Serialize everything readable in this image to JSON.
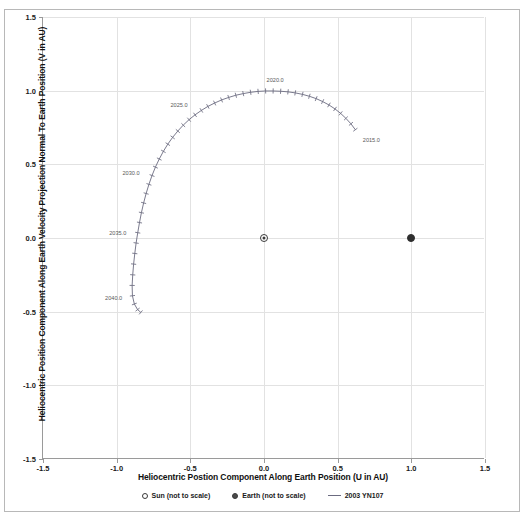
{
  "figure": {
    "top_clipped_text": "",
    "background": "#ffffff",
    "frame_color": "#b8b8b8"
  },
  "axes": {
    "x": {
      "title": "Heliocentric Postion Component Along Earth Position (U in AU)",
      "ticks": [
        -1.5,
        -1.0,
        -0.5,
        0.0,
        0.5,
        1.0,
        1.5
      ],
      "tick_labels": [
        "-1.5",
        "-1.0",
        "-0.5",
        "0.0",
        "0.5",
        "1.0",
        "1.5"
      ],
      "min": -1.5,
      "max": 1.5
    },
    "y": {
      "title": "Heliocentric Position Component Along Earth Velocity Projection Normal To Earth Position (V in AU)",
      "ticks": [
        -1.5,
        -1.0,
        -0.5,
        0.0,
        0.5,
        1.0,
        1.5
      ],
      "tick_labels": [
        "-1.5",
        "-1.0",
        "-0.5",
        "0.0",
        "0.5",
        "1.0",
        "1.5"
      ],
      "min": -1.5,
      "max": 1.5
    },
    "grid": true,
    "grid_color": "#e2e2e2"
  },
  "legend": {
    "position": "bottom",
    "items": [
      {
        "label": "Sun (not to scale)",
        "marker": "open-circle-icon",
        "color": "#3a3a3a"
      },
      {
        "label": "Earth (not to scale)",
        "marker": "filled-circle-icon",
        "color": "#3a3a3a"
      },
      {
        "label": "2003 YN107",
        "marker": "line-icon",
        "color": "#6b6b80"
      }
    ]
  },
  "chart_data": {
    "type": "scatter",
    "title": "",
    "subtitle": "",
    "xlabel": "Heliocentric Postion Component Along Earth Position (U in AU)",
    "ylabel": "Heliocentric Position Component Along Earth Velocity Projection Normal To Earth Position (V in AU)",
    "xlim": [
      -1.5,
      1.5
    ],
    "ylim": [
      -1.5,
      1.5
    ],
    "grid": true,
    "legend_position": "bottom",
    "series": [
      {
        "name": "Sun (not to scale)",
        "marker": "filled-circle",
        "points": [
          {
            "x": 1.0,
            "y": 0.0
          }
        ]
      },
      {
        "name": "Earth (not to scale)",
        "marker": "ringed-circle",
        "points": [
          {
            "x": 0.0,
            "y": 0.0
          }
        ]
      },
      {
        "name": "2003 YN107",
        "marker": "line-with-ticks",
        "color": "#6b6b80",
        "description": "Horseshoe / quasi-satellite trajectory of asteroid 2003 YN107 plotted in the Earth co-rotating frame; epoch markers every year.",
        "points": [
          {
            "x": 0.62,
            "y": 0.735
          },
          {
            "x": 0.59,
            "y": 0.775
          },
          {
            "x": 0.556,
            "y": 0.812
          },
          {
            "x": 0.52,
            "y": 0.846
          },
          {
            "x": 0.482,
            "y": 0.876
          },
          {
            "x": 0.441,
            "y": 0.903
          },
          {
            "x": 0.398,
            "y": 0.926
          },
          {
            "x": 0.354,
            "y": 0.946
          },
          {
            "x": 0.308,
            "y": 0.962
          },
          {
            "x": 0.261,
            "y": 0.975
          },
          {
            "x": 0.212,
            "y": 0.985
          },
          {
            "x": 0.163,
            "y": 0.992
          },
          {
            "x": 0.113,
            "y": 0.996
          },
          {
            "x": 0.062,
            "y": 0.998
          },
          {
            "x": 0.011,
            "y": 0.998
          },
          {
            "x": -0.04,
            "y": 0.995
          },
          {
            "x": -0.091,
            "y": 0.989
          },
          {
            "x": -0.141,
            "y": 0.98
          },
          {
            "x": -0.191,
            "y": 0.969
          },
          {
            "x": -0.24,
            "y": 0.954
          },
          {
            "x": -0.288,
            "y": 0.937
          },
          {
            "x": -0.335,
            "y": 0.916
          },
          {
            "x": -0.381,
            "y": 0.893
          },
          {
            "x": -0.425,
            "y": 0.866
          },
          {
            "x": -0.468,
            "y": 0.836
          },
          {
            "x": -0.509,
            "y": 0.803
          },
          {
            "x": -0.548,
            "y": 0.766
          },
          {
            "x": -0.585,
            "y": 0.726
          },
          {
            "x": -0.62,
            "y": 0.683
          },
          {
            "x": -0.653,
            "y": 0.637
          },
          {
            "x": -0.683,
            "y": 0.588
          },
          {
            "x": -0.711,
            "y": 0.536
          },
          {
            "x": -0.737,
            "y": 0.481
          },
          {
            "x": -0.76,
            "y": 0.424
          },
          {
            "x": -0.781,
            "y": 0.364
          },
          {
            "x": -0.8,
            "y": 0.302
          },
          {
            "x": -0.817,
            "y": 0.238
          },
          {
            "x": -0.832,
            "y": 0.172
          },
          {
            "x": -0.845,
            "y": 0.105
          },
          {
            "x": -0.857,
            "y": 0.036
          },
          {
            "x": -0.868,
            "y": -0.034
          },
          {
            "x": -0.877,
            "y": -0.105
          },
          {
            "x": -0.885,
            "y": -0.177
          },
          {
            "x": -0.891,
            "y": -0.25
          },
          {
            "x": -0.895,
            "y": -0.322
          },
          {
            "x": -0.893,
            "y": -0.392
          },
          {
            "x": -0.88,
            "y": -0.448
          },
          {
            "x": -0.858,
            "y": -0.486
          },
          {
            "x": -0.836,
            "y": -0.505
          }
        ],
        "epoch_labels": [
          {
            "text": "2015.0",
            "x": 0.62,
            "y": 0.735
          },
          {
            "text": "2020.0",
            "x": 0.062,
            "y": 0.998
          },
          {
            "text": "2025.0",
            "x": -0.468,
            "y": 0.836
          },
          {
            "text": "2030.0",
            "x": -0.76,
            "y": 0.424
          },
          {
            "text": "2035.0",
            "x": -0.857,
            "y": 0.036
          },
          {
            "text": "2040.0",
            "x": -0.885,
            "y": -0.392
          }
        ]
      }
    ]
  }
}
